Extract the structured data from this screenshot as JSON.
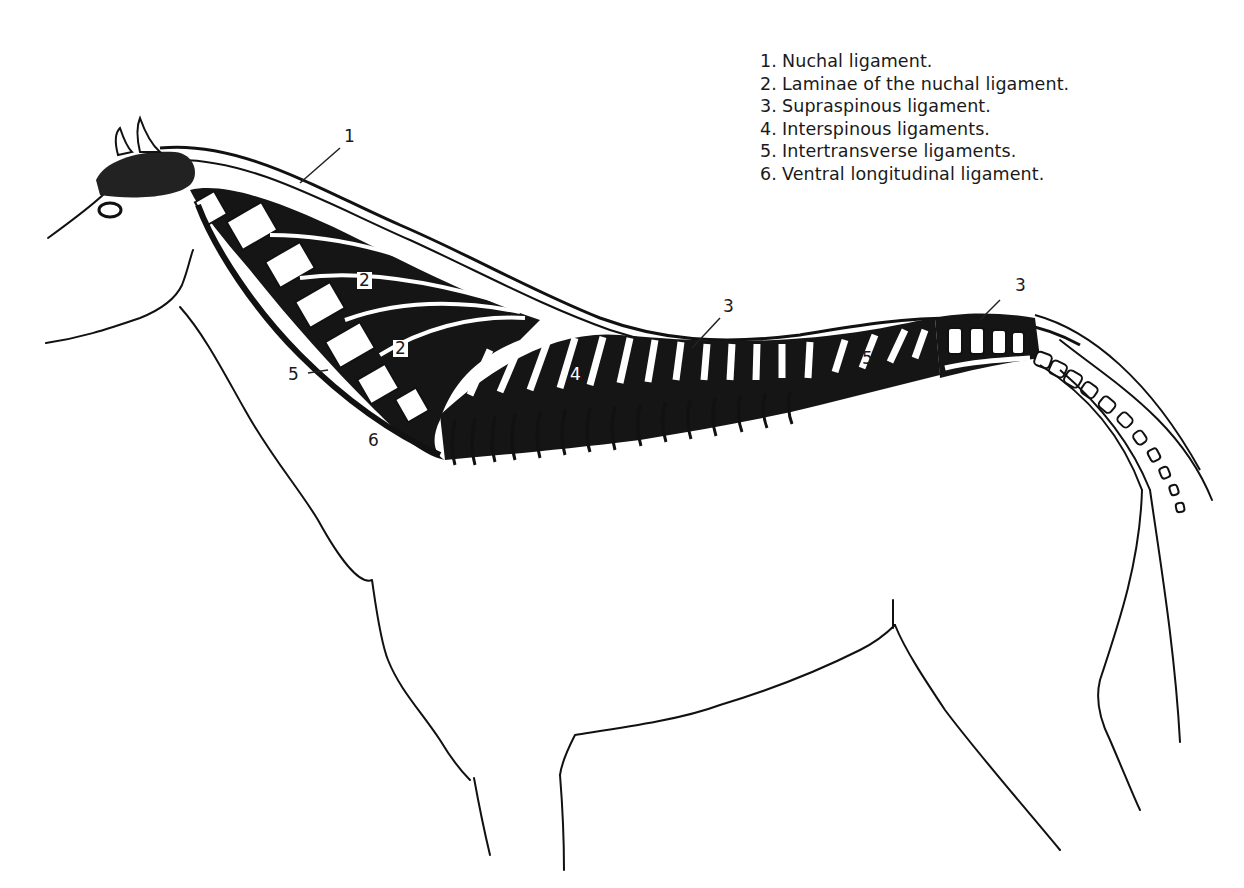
{
  "figure": {
    "title_hint": "Nuchal, supraspinous and related ligaments of the vertebral column (lateral view)",
    "colors": {
      "ink": "#111111",
      "background": "#ffffff"
    }
  },
  "legend": {
    "items": [
      {
        "num": "1.",
        "text": "Nuchal ligament."
      },
      {
        "num": "2.",
        "text": "Laminae of the nuchal ligament."
      },
      {
        "num": "3.",
        "text": "Supraspinous ligament."
      },
      {
        "num": "4.",
        "text": "Interspinous ligaments."
      },
      {
        "num": "5.",
        "text": "Intertransverse ligaments."
      },
      {
        "num": "6.",
        "text": "Ventral longitudinal ligament."
      }
    ]
  },
  "labels": [
    {
      "id": "nuchal",
      "text": "1"
    },
    {
      "id": "laminae-upper",
      "text": "2"
    },
    {
      "id": "laminae-lower",
      "text": "2"
    },
    {
      "id": "supraspinous-back",
      "text": "3"
    },
    {
      "id": "supraspinous-sacrum",
      "text": "3"
    },
    {
      "id": "interspinous",
      "text": "4"
    },
    {
      "id": "intertransverse-neck",
      "text": "5"
    },
    {
      "id": "intertransverse-lumbar",
      "text": "5"
    },
    {
      "id": "ventral-longitudinal",
      "text": "6"
    }
  ]
}
